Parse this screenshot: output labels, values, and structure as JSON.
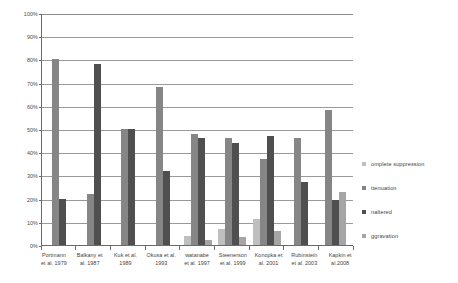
{
  "chart_data": {
    "type": "bar",
    "title": "",
    "xlabel": "",
    "ylabel": "",
    "ylim": [
      0,
      100
    ],
    "ytick_labels": [
      "100%",
      "90%",
      "80%",
      "70%",
      "60%",
      "50%",
      "40%",
      "30%",
      "20%",
      "10%",
      "0%"
    ],
    "ytick_values": [
      100,
      90,
      80,
      70,
      60,
      50,
      40,
      30,
      20,
      10,
      0
    ],
    "grid": true,
    "legend_position": "right",
    "categories": [
      "Portmann et al. 1979",
      "Balkany et al. 1987",
      "Kuk et al. 1989",
      "Okusa et al. 1993",
      "watanabe et al. 1997",
      "Steenerson et al. 1999",
      "Konopka et al. 2001",
      "Rubinstein et al. 2003",
      "Kapkin et al.2008"
    ],
    "category_lines": [
      [
        "Portmann",
        "et al. 1979"
      ],
      [
        "Balkany et",
        "al. 1987"
      ],
      [
        "Kuk et al.",
        "1989"
      ],
      [
        "Okusa et al.",
        "1993"
      ],
      [
        "watanabe",
        "et al. 1997"
      ],
      [
        "Steenerson",
        "et al. 1999"
      ],
      [
        "Konopka et",
        "al. 2001"
      ],
      [
        "Rubinstein",
        "et al. 2003"
      ],
      [
        "Kapkin et",
        "al.2008"
      ]
    ],
    "series": [
      {
        "name": "omplete suppression",
        "color": "#bfbfbf",
        "values": [
          null,
          null,
          null,
          null,
          4,
          7,
          11,
          null,
          null
        ]
      },
      {
        "name": "ttenuation",
        "color": "#868686",
        "values": [
          80,
          22,
          50,
          68,
          48,
          46,
          37,
          46,
          58
        ]
      },
      {
        "name": "naltered",
        "color": "#4f4f4f",
        "values": [
          20,
          78,
          50,
          32,
          46,
          44,
          47,
          27,
          19.5
        ]
      },
      {
        "name": "ggravation",
        "color": "#a5a5a5",
        "values": [
          null,
          null,
          null,
          null,
          2,
          3.5,
          6,
          null,
          23
        ]
      }
    ]
  },
  "legend": {
    "items": [
      {
        "label": "omplete suppression",
        "color": "#bfbfbf"
      },
      {
        "label": "ttenuation",
        "color": "#868686"
      },
      {
        "label": "naltered",
        "color": "#4f4f4f"
      },
      {
        "label": "ggravation",
        "color": "#a5a5a5"
      }
    ]
  }
}
